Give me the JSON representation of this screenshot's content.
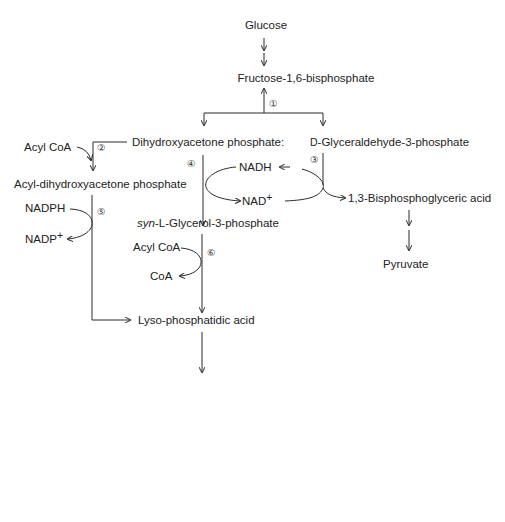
{
  "diagram": {
    "compounds": {
      "glucose": "Glucose",
      "fructose_bp": "Fructose-1,6-bisphosphate",
      "dhap": "Dihydroxyacetone phosphate:",
      "g3p_prefix": "D",
      "g3p": "-Glyceraldehyde-3-phosphate",
      "acyl_dhap": "Acyl-dihydroxyacetone phosphate",
      "bpg": "1,3-Bisphosphoglyceric acid",
      "pyruvate": "Pyruvate",
      "glycerol3p_prefix": "syn",
      "glycerol3p": "-L-Glycerol-3-phosphate",
      "lyso_pa": "Lyso-phosphatidic acid",
      "pa": "Phosphatidic acid",
      "dag": "1,2-Diacyl-glycerol",
      "tag": "Triacyglycerol"
    },
    "cofactors": {
      "acyl_coa_2": "Acyl CoA",
      "nadh": "NADH",
      "nad": "NAD+",
      "nadph": "NADPH",
      "nadp": "NADP+",
      "acyl_coa_6": "Acyl CoA",
      "coa_6": "CoA",
      "acyl_coa_7": "Acyl CoA",
      "fatty_acids_7": "Fatty acids",
      "coa_7": "CoA",
      "enzyme_8_line1": "Phosphatidate",
      "enzyme_8_line2": "phosphatase",
      "pi": "Pi",
      "acyl_coa_9": "Acyl CoA",
      "fatty_acids_9": "Fatty acids",
      "coa_9": "CoA"
    },
    "steps": [
      "①",
      "②",
      "③",
      "④",
      "⑤",
      "⑥",
      "⑦",
      "⑧",
      "⑨"
    ]
  }
}
